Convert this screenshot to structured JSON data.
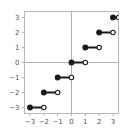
{
  "chart_data": {
    "type": "line",
    "title": "",
    "subtitle": "",
    "xlabel": "",
    "ylabel": "",
    "xlim": [
      -3.4,
      3.4
    ],
    "ylim": [
      -3.4,
      3.4
    ],
    "grid": false,
    "legend": null,
    "xticks": [
      -3,
      -2,
      -1,
      0,
      1,
      2,
      3
    ],
    "xtick_labels": [
      "−3",
      "−2",
      "−1",
      "0",
      "1",
      "2",
      "3"
    ],
    "yticks": [
      -3,
      -2,
      -1,
      0,
      1,
      2,
      3
    ],
    "ytick_labels": [
      "−3",
      "−2",
      "−1",
      "0",
      "1",
      "2",
      "3"
    ],
    "series": [
      {
        "name": "floor(x)",
        "marker_left": "filled-circle",
        "marker_right": "open-circle",
        "color": "#1a1a1a",
        "segments": [
          {
            "x_start": -3,
            "x_end": -2,
            "y": -3,
            "left_closed": true,
            "right_closed": false
          },
          {
            "x_start": -2,
            "x_end": -1,
            "y": -2,
            "left_closed": true,
            "right_closed": false
          },
          {
            "x_start": -1,
            "x_end": 0,
            "y": -1,
            "left_closed": true,
            "right_closed": false
          },
          {
            "x_start": 0,
            "x_end": 1,
            "y": 0,
            "left_closed": true,
            "right_closed": false
          },
          {
            "x_start": 1,
            "x_end": 2,
            "y": 1,
            "left_closed": true,
            "right_closed": false
          },
          {
            "x_start": 2,
            "x_end": 3,
            "y": 2,
            "left_closed": true,
            "right_closed": false
          },
          {
            "x_start": 3,
            "x_end": 3.4,
            "y": 3,
            "left_closed": true,
            "right_closed": false
          }
        ]
      }
    ],
    "axis_lines": {
      "x_axis_at_y": 0,
      "y_axis_at_x": 0,
      "color": "#b0b0b0"
    },
    "frame": {
      "color": "#b8b8b8",
      "visible": true
    },
    "colors": {
      "data": "#1a1a1a",
      "axis": "#b0b0b0",
      "frame": "#b8b8b8",
      "tick_text": "#555555",
      "background": "#ffffff"
    }
  }
}
